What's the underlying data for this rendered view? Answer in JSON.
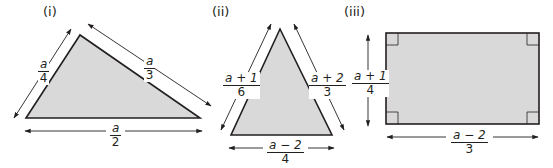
{
  "figure": {
    "colors": {
      "fill": "#d9d9d9",
      "stroke": "#231f20",
      "arrow": "#231f20"
    },
    "shapes": [
      {
        "label": "(i)",
        "type": "triangle",
        "sides": [
          {
            "numerator": "a",
            "denominator": "4",
            "position": "left"
          },
          {
            "numerator": "a",
            "denominator": "3",
            "position": "right"
          },
          {
            "numerator": "a",
            "denominator": "2",
            "position": "bottom"
          }
        ]
      },
      {
        "label": "(ii)",
        "type": "triangle",
        "sides": [
          {
            "numerator": "a + 1",
            "denominator": "6",
            "position": "left"
          },
          {
            "numerator": "a + 2",
            "denominator": "3",
            "position": "right"
          },
          {
            "numerator": "a − 2",
            "denominator": "4",
            "position": "bottom"
          }
        ]
      },
      {
        "label": "(iii)",
        "type": "rectangle",
        "sides": [
          {
            "numerator": "a + 1",
            "denominator": "4",
            "position": "left"
          },
          {
            "numerator": "a − 2",
            "denominator": "3",
            "position": "bottom"
          }
        ]
      }
    ]
  }
}
